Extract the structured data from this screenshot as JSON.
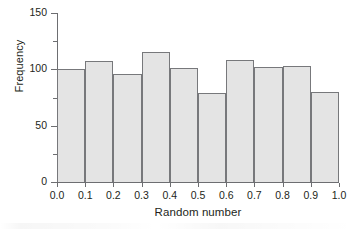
{
  "chart_data": {
    "type": "bar",
    "title": "",
    "subtitle": "",
    "xlabel": "Random number",
    "ylabel": "Frequency",
    "categories": [
      "0.0-0.1",
      "0.1-0.2",
      "0.2-0.3",
      "0.3-0.4",
      "0.4-0.5",
      "0.5-0.6",
      "0.6-0.7",
      "0.7-0.8",
      "0.8-0.9",
      "0.9-1.0"
    ],
    "bin_edges": [
      0.0,
      0.1,
      0.2,
      0.3,
      0.4,
      0.5,
      0.6,
      0.7,
      0.8,
      0.9,
      1.0
    ],
    "values": [
      100,
      107,
      96,
      115,
      101,
      79,
      108,
      102,
      103,
      80
    ],
    "xlim": [
      0.0,
      1.0
    ],
    "ylim": [
      0,
      150
    ],
    "x_tick_labels": [
      "0.0",
      "0.1",
      "0.2",
      "0.3",
      "0.4",
      "0.5",
      "0.6",
      "0.7",
      "0.8",
      "0.9",
      "1.0"
    ],
    "x_tick_values": [
      0.0,
      0.1,
      0.2,
      0.3,
      0.4,
      0.5,
      0.6,
      0.7,
      0.8,
      0.9,
      1.0
    ],
    "y_tick_labels": [
      "0",
      "50",
      "100",
      "150"
    ],
    "y_tick_values": [
      0,
      50,
      100,
      150
    ],
    "y_minor_tick_values": [
      25,
      75,
      125
    ],
    "grid": false,
    "legend": null,
    "legend_position": "none",
    "annotations": [],
    "bar_fill_color": "#e4e4e4",
    "bar_edge_color": "#77787b",
    "axis_color": "#6d6e71",
    "text_color": "#231f20",
    "background_color": "#ffffff"
  }
}
